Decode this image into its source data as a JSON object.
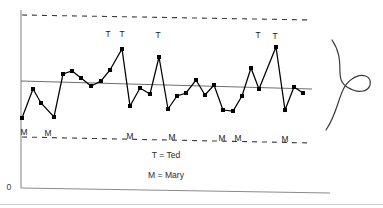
{
  "figure": {
    "title": "",
    "origin_label": "0",
    "legend": [
      {
        "key": "T",
        "text": "T = Ted"
      },
      {
        "key": "M",
        "text": "M = Mary"
      }
    ]
  },
  "colors": {
    "line": "#000000",
    "marker": "#000000",
    "center_line": "#6e6e6e",
    "limit_line": "#3c3c3c",
    "axis": "#8a8a8a",
    "curve": "#3a3a3a",
    "background": "#ffffff",
    "text": "#222222"
  },
  "chart_data": {
    "type": "line",
    "title": "",
    "subtitle": "",
    "xlabel": "",
    "ylabel": "",
    "grid": false,
    "legend_position": "bottom-center",
    "axis": {
      "y_axis_x": 21,
      "y_axis_top": 10,
      "y_axis_bottom": 188,
      "x_axis_y_left": 188,
      "x_axis_y_right": 193,
      "x_axis_x_end": 330,
      "xlim": [
        0,
        41
      ],
      "ylim": [
        0,
        100
      ],
      "ticks": [],
      "tick_labels": []
    },
    "reference_lines": [
      {
        "name": "upper-control-limit",
        "style": "dashed",
        "x_start": 22,
        "y_start": 15,
        "x_end": 312,
        "y_end": 20
      },
      {
        "name": "center-line",
        "style": "solid",
        "x_start": 21,
        "y_start": 81,
        "x_end": 312,
        "y_end": 89
      },
      {
        "name": "lower-control-limit",
        "style": "dashed",
        "x_start": 22,
        "y_start": 137,
        "x_end": 312,
        "y_end": 143
      }
    ],
    "series": [
      {
        "name": "Individual measurements",
        "marker": "square",
        "marker_size": 4,
        "points": [
          {
            "i": 1,
            "x": 22,
            "y": 118
          },
          {
            "i": 2,
            "x": 33,
            "y": 89
          },
          {
            "i": 3,
            "x": 41,
            "y": 103
          },
          {
            "i": 4,
            "x": 54,
            "y": 117
          },
          {
            "i": 5,
            "x": 63,
            "y": 74
          },
          {
            "i": 6,
            "x": 72,
            "y": 71
          },
          {
            "i": 7,
            "x": 81,
            "y": 78
          },
          {
            "i": 8,
            "x": 91,
            "y": 86
          },
          {
            "i": 9,
            "x": 101,
            "y": 81
          },
          {
            "i": 10,
            "x": 110,
            "y": 70
          },
          {
            "i": 11,
            "x": 122,
            "y": 49
          },
          {
            "i": 12,
            "x": 130,
            "y": 106
          },
          {
            "i": 13,
            "x": 140,
            "y": 88
          },
          {
            "i": 14,
            "x": 150,
            "y": 94
          },
          {
            "i": 15,
            "x": 159,
            "y": 57
          },
          {
            "i": 16,
            "x": 168,
            "y": 109
          },
          {
            "i": 17,
            "x": 177,
            "y": 96
          },
          {
            "i": 18,
            "x": 186,
            "y": 93
          },
          {
            "i": 19,
            "x": 196,
            "y": 80
          },
          {
            "i": 20,
            "x": 205,
            "y": 95
          },
          {
            "i": 21,
            "x": 214,
            "y": 85
          },
          {
            "i": 22,
            "x": 223,
            "y": 110
          },
          {
            "i": 23,
            "x": 233,
            "y": 111
          },
          {
            "i": 24,
            "x": 242,
            "y": 96
          },
          {
            "i": 25,
            "x": 251,
            "y": 68
          },
          {
            "i": 26,
            "x": 259,
            "y": 89
          },
          {
            "i": 27,
            "x": 276,
            "y": 47
          },
          {
            "i": 28,
            "x": 285,
            "y": 110
          },
          {
            "i": 29,
            "x": 294,
            "y": 87
          },
          {
            "i": 30,
            "x": 303,
            "y": 93
          }
        ]
      }
    ],
    "point_annotations": [
      {
        "label": "T",
        "x": 108,
        "y": 37
      },
      {
        "label": "T",
        "x": 122,
        "y": 37
      },
      {
        "label": "T",
        "x": 158,
        "y": 38
      },
      {
        "label": "T",
        "x": 258,
        "y": 38
      },
      {
        "label": "T",
        "x": 275,
        "y": 39
      }
    ],
    "baseline_annotations": [
      {
        "label": "M",
        "x": 24,
        "y": 135
      },
      {
        "label": "M",
        "x": 48,
        "y": 136
      },
      {
        "label": "M",
        "x": 130,
        "y": 139
      },
      {
        "label": "M",
        "x": 172,
        "y": 140
      },
      {
        "label": "M",
        "x": 222,
        "y": 141
      },
      {
        "label": "M",
        "x": 238,
        "y": 141
      },
      {
        "label": "M",
        "x": 285,
        "y": 142
      }
    ],
    "legend_labels": [
      {
        "text": "T = Ted",
        "x": 166,
        "y": 158
      },
      {
        "text": "M = Mary",
        "x": 166,
        "y": 178
      }
    ],
    "distribution_curve": {
      "name": "normal-distribution-sideways",
      "orientation": "vertical",
      "path": "M 332 40 C 347 62, 333 78, 347 87 C 358 94, 368 92, 370 85 C 372 76, 362 72, 352 79 C 338 88, 340 110, 326 130"
    }
  }
}
